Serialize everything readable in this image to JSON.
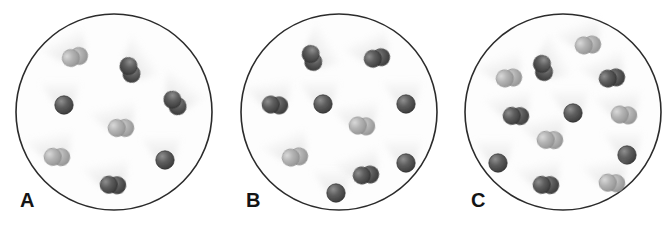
{
  "figure": {
    "width": 671,
    "height": 234,
    "background": "#ffffff"
  },
  "legend_colors": {
    "dark_atom_fill": "#4b4b4b",
    "dark_atom_edge": "#2e2e2e",
    "light_atom_fill": "#a8a8a8",
    "light_atom_edge": "#8a8a8a",
    "circle_stroke": "#2b2b2b",
    "shadow": "#d6d6d6",
    "label_color": "#141414"
  },
  "panels": [
    {
      "id": "panel-a",
      "label": "A",
      "label_x": 20,
      "label_y": 190,
      "circle": {
        "cx": 114,
        "cy": 112,
        "r": 98,
        "stroke_width": 1.6
      },
      "counts": {
        "dark_diatomic": 4,
        "light_diatomic": 3,
        "single_dark_atom": 2,
        "total_particles": 9
      },
      "particles": [
        {
          "type": "light-diatomic",
          "x": 75,
          "y": 57,
          "angle": -28
        },
        {
          "type": "dark-diatomic",
          "x": 130,
          "y": 70,
          "angle": 55
        },
        {
          "type": "dark-diatomic",
          "x": 175,
          "y": 103,
          "angle": 38
        },
        {
          "type": "single-dark-atom",
          "x": 64,
          "y": 105,
          "angle": 0
        },
        {
          "type": "light-diatomic",
          "x": 121,
          "y": 128,
          "angle": -14
        },
        {
          "type": "light-diatomic",
          "x": 57,
          "y": 157,
          "angle": -12
        },
        {
          "type": "single-dark-atom",
          "x": 165,
          "y": 160,
          "angle": 0
        },
        {
          "type": "dark-diatomic",
          "x": 113,
          "y": 185,
          "angle": -10
        }
      ]
    },
    {
      "id": "panel-b",
      "label": "B",
      "label_x": 246,
      "label_y": 190,
      "circle": {
        "cx": 339,
        "cy": 112,
        "r": 98,
        "stroke_width": 1.6
      },
      "counts": {
        "dark_diatomic": 5,
        "light_diatomic": 2,
        "single_dark_atom": 3,
        "total_particles": 10
      },
      "particles": [
        {
          "type": "dark-diatomic",
          "x": 312,
          "y": 58,
          "angle": 58
        },
        {
          "type": "dark-diatomic",
          "x": 377,
          "y": 58,
          "angle": -24
        },
        {
          "type": "dark-diatomic",
          "x": 275,
          "y": 105,
          "angle": -8
        },
        {
          "type": "single-dark-atom",
          "x": 323,
          "y": 104,
          "angle": 0
        },
        {
          "type": "single-dark-atom",
          "x": 406,
          "y": 104,
          "angle": 0
        },
        {
          "type": "light-diatomic",
          "x": 362,
          "y": 126,
          "angle": -8
        },
        {
          "type": "light-diatomic",
          "x": 295,
          "y": 157,
          "angle": -22
        },
        {
          "type": "single-dark-atom",
          "x": 336,
          "y": 193,
          "angle": 0
        },
        {
          "type": "dark-diatomic",
          "x": 366,
          "y": 175,
          "angle": -20
        },
        {
          "type": "single-dark-atom",
          "x": 406,
          "y": 163,
          "angle": 0
        }
      ]
    },
    {
      "id": "panel-c",
      "label": "C",
      "label_x": 471,
      "label_y": 190,
      "circle": {
        "cx": 563,
        "cy": 112,
        "r": 98,
        "stroke_width": 1.6
      },
      "counts": {
        "dark_diatomic": 6,
        "light_diatomic": 5,
        "single_dark_atom": 3,
        "total_particles": 14
      },
      "particles": [
        {
          "type": "light-diatomic",
          "x": 588,
          "y": 45,
          "angle": -20
        },
        {
          "type": "dark-diatomic",
          "x": 543,
          "y": 68,
          "angle": 62
        },
        {
          "type": "light-diatomic",
          "x": 509,
          "y": 78,
          "angle": -20
        },
        {
          "type": "dark-diatomic",
          "x": 612,
          "y": 78,
          "angle": -22
        },
        {
          "type": "dark-diatomic",
          "x": 516,
          "y": 116,
          "angle": -12
        },
        {
          "type": "single-dark-atom",
          "x": 573,
          "y": 113,
          "angle": 0
        },
        {
          "type": "light-diatomic",
          "x": 624,
          "y": 115,
          "angle": -8
        },
        {
          "type": "light-diatomic",
          "x": 550,
          "y": 140,
          "angle": -12
        },
        {
          "type": "single-dark-atom",
          "x": 498,
          "y": 163,
          "angle": 0
        },
        {
          "type": "single-dark-atom",
          "x": 627,
          "y": 155,
          "angle": 0
        },
        {
          "type": "dark-diatomic",
          "x": 546,
          "y": 185,
          "angle": -12
        },
        {
          "type": "light-diatomic",
          "x": 612,
          "y": 183,
          "angle": -10
        }
      ]
    }
  ]
}
